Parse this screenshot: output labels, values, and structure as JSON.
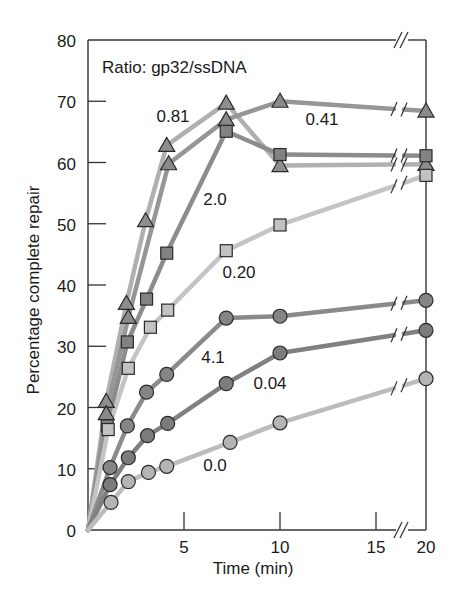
{
  "chart_data": {
    "type": "line",
    "title": "Ratio: gp32/ssDNA",
    "xlabel": "Time (min)",
    "ylabel": "Percentage complete repair",
    "xlim": [
      0,
      20
    ],
    "ylim": [
      0,
      80
    ],
    "x_axis_break": "between 15 and 20",
    "x_ticks": [
      5,
      10,
      15,
      20
    ],
    "y_ticks": [
      0,
      10,
      20,
      30,
      40,
      50,
      60,
      70,
      80
    ],
    "grid": false,
    "legend": "inline labels",
    "series": [
      {
        "name": "0.81",
        "marker": "triangle",
        "fill": "#8e8e8e",
        "line": "#b0b0b0",
        "x": [
          0,
          0.95,
          2.0,
          3.0,
          4.1,
          7.2,
          10,
          20
        ],
        "values": [
          0,
          21,
          37,
          50.5,
          62.8,
          69.7,
          59.5,
          59.7
        ],
        "label_pos": [
          173,
          122
        ]
      },
      {
        "name": "0.41",
        "marker": "triangle",
        "fill": "#8a8a8a",
        "line": "#969696",
        "x": [
          0,
          0.95,
          2.1,
          4.2,
          7.2,
          10,
          20
        ],
        "values": [
          0,
          19,
          34.7,
          59.8,
          67,
          70,
          68.4
        ],
        "label_pos": [
          322,
          125
        ]
      },
      {
        "name": "2.0",
        "marker": "square",
        "fill": "#828282",
        "line": "#8c8c8c",
        "x": [
          0,
          1.0,
          2.05,
          3.05,
          4.1,
          7.2,
          10,
          20
        ],
        "values": [
          0,
          17,
          30.7,
          37.7,
          45.2,
          65.1,
          61.3,
          61.1
        ],
        "label_pos": [
          215,
          205
        ]
      },
      {
        "name": "0.20",
        "marker": "square",
        "fill": "#c2c2c2",
        "line": "#c4c4c4",
        "x": [
          0,
          1.05,
          2.1,
          3.25,
          4.15,
          7.2,
          10,
          20
        ],
        "values": [
          0,
          16.4,
          26.4,
          33.1,
          35.9,
          45.6,
          49.8,
          57.9
        ],
        "label_pos": [
          239,
          278
        ]
      },
      {
        "name": "4.1",
        "marker": "circle",
        "fill": "#858585",
        "line": "#8a8a8a",
        "x": [
          0,
          1.15,
          2.05,
          3.05,
          4.1,
          7.2,
          10,
          20
        ],
        "values": [
          0,
          10.2,
          17,
          22.5,
          25.4,
          34.6,
          34.9,
          37.5
        ],
        "label_pos": [
          213,
          363
        ]
      },
      {
        "name": "0.04",
        "marker": "circle",
        "fill": "#7c7c7c",
        "line": "#808080",
        "x": [
          0,
          1.15,
          2.1,
          3.1,
          4.15,
          7.2,
          10,
          20
        ],
        "values": [
          0,
          7.4,
          11.8,
          15.4,
          17.4,
          23.9,
          28.9,
          32.6
        ],
        "label_pos": [
          270,
          389
        ]
      },
      {
        "name": "0.0",
        "marker": "circle",
        "fill": "#b4b4b4",
        "line": "#bcbcbc",
        "x": [
          0,
          1.2,
          2.1,
          3.15,
          4.1,
          7.4,
          10,
          20
        ],
        "values": [
          0,
          4.5,
          7.9,
          9.4,
          10.4,
          14.3,
          17.5,
          24.7
        ],
        "label_pos": [
          215,
          471
        ]
      }
    ]
  }
}
